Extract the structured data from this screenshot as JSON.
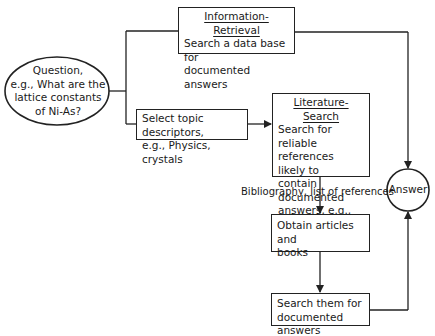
{
  "diagram": {
    "question": {
      "lines": [
        "Question,",
        "e.g., What are the",
        "lattice constants",
        "of Ni-As?"
      ]
    },
    "information_retrieval": {
      "title": "Information-Retrieval",
      "lines": [
        "Search a data base for",
        "documented answers"
      ]
    },
    "select_topic": {
      "lines": [
        "Select topic descriptors,",
        "e.g., Physics, crystals"
      ]
    },
    "literature_search": {
      "title": "Literature-Search",
      "lines": [
        "Search for reliable",
        "references likely to",
        "contain documented",
        "answers, e.g.,"
      ],
      "last_line_prefix": "Gray's ",
      "last_line_italic": "AIP Handbook"
    },
    "bibliography_label": "Bibliography, list of references",
    "obtain": {
      "lines": [
        "Obtain articles and",
        "books"
      ]
    },
    "search_them": {
      "lines": [
        "Search them for",
        "documented answers"
      ]
    },
    "answer": "Answer"
  }
}
